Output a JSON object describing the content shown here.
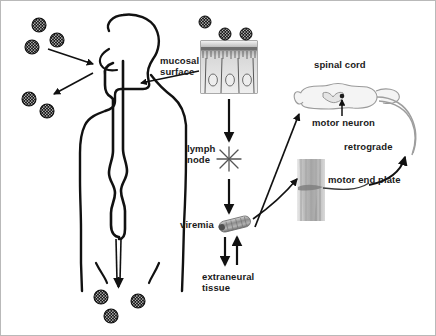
{
  "figure": {
    "background_color": "#ffffff",
    "border_color": "#b9b9b9",
    "width": 436,
    "height": 336
  },
  "labels": {
    "mucosal_surface": "mucosal\nsurface",
    "lymph_node": "lymph\nnode",
    "viremia": "viremia",
    "extraneural_tissue": "extraneural\ntissue",
    "spinal_cord": "spinal cord",
    "motor_neuron": "motor neuron",
    "retrograde": "retrograde",
    "motor_end_plate": "motor end plate"
  },
  "elements": {
    "body_silhouette": "human-body-outline-with-airway",
    "virus_particle": "virus-particle",
    "lymph_node_glyph": "star-burst",
    "virion_glyph": "capsule-virion",
    "mucosa_inset": "columnar-epithelium-micrograph",
    "spinal_cord_glyph": "spinal-cord-cross-section",
    "end_plate_glyph": "motor-end-plate-micrograph"
  },
  "virus_particles": {
    "upper_left": [
      {
        "cx": 38,
        "cy": 24,
        "r": 7
      },
      {
        "cx": 31,
        "cy": 46,
        "r": 7
      },
      {
        "cx": 56,
        "cy": 39,
        "r": 7
      },
      {
        "cx": 28,
        "cy": 98,
        "r": 7
      },
      {
        "cx": 46,
        "cy": 110,
        "r": 7
      }
    ],
    "mucosa_inset": [
      {
        "cx": 204,
        "cy": 21,
        "r": 6
      },
      {
        "cx": 224,
        "cy": 33,
        "r": 6
      },
      {
        "cx": 245,
        "cy": 33,
        "r": 6
      }
    ],
    "lower_center": [
      {
        "cx": 100,
        "cy": 296,
        "r": 7
      },
      {
        "cx": 137,
        "cy": 300,
        "r": 7
      },
      {
        "cx": 110,
        "cy": 315,
        "r": 7
      }
    ]
  },
  "colors": {
    "ink": "#111111",
    "label_text": "#1a1a1a",
    "micrograph_gray": "#a8a8a8",
    "frame": "#b9b9b9"
  }
}
